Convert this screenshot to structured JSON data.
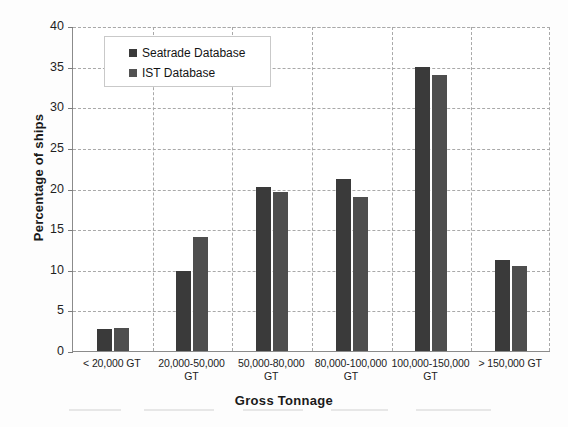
{
  "chart_data": {
    "type": "bar",
    "title": "",
    "xlabel": "Gross Tonnage",
    "ylabel": "Percentage of ships",
    "ylim": [
      0,
      40
    ],
    "ytick_step": 5,
    "ytick_labels": [
      "0",
      "5",
      "10",
      "15",
      "20",
      "25",
      "30",
      "35",
      "40"
    ],
    "grid": "dashed both axes",
    "legend_position": "top-left inside plot",
    "categories": [
      "< 20,000 GT",
      "20,000-50,000 GT",
      "50,000-80,000 GT",
      "80,000-100,000 GT",
      "100,000-150,000 GT",
      "> 150,000 GT"
    ],
    "category_lines": [
      [
        "< 20,000 GT",
        ""
      ],
      [
        "20,000-50,000",
        "GT"
      ],
      [
        "50,000-80,000",
        "GT"
      ],
      [
        "80,000-100,000",
        "GT"
      ],
      [
        "100,000-150,000",
        "GT"
      ],
      [
        "> 150,000 GT",
        ""
      ]
    ],
    "series": [
      {
        "name": "Seatrade Database",
        "color": "#3a3a3a",
        "values": [
          2.7,
          9.8,
          20.2,
          21.2,
          35.0,
          11.2
        ]
      },
      {
        "name": "IST Database",
        "color": "#4e4e4e",
        "values": [
          2.8,
          14.0,
          19.6,
          19.0,
          34.0,
          10.5
        ]
      }
    ]
  },
  "legend": {
    "items": [
      {
        "label": "Seatrade Database"
      },
      {
        "label": "IST Database"
      }
    ]
  },
  "axes": {
    "x_title": "Gross Tonnage",
    "y_title": "Percentage of ships"
  }
}
